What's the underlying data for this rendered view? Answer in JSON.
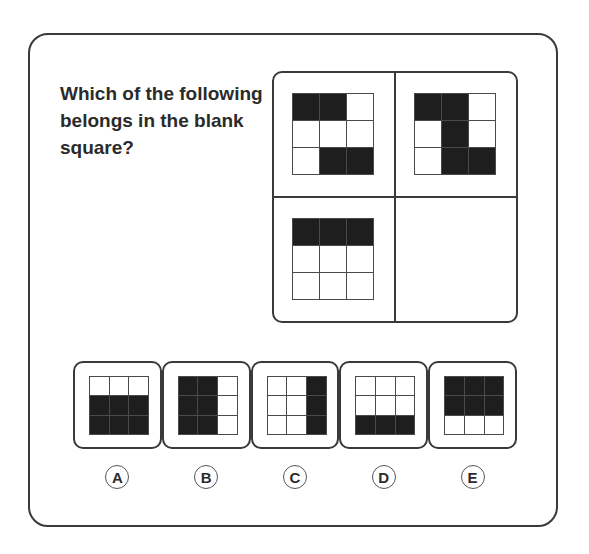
{
  "question": "Which of the following belongs in the blank square?",
  "matrix": {
    "cells": [
      {
        "position": "top-left",
        "pattern": [
          [
            1,
            1,
            0
          ],
          [
            0,
            0,
            0
          ],
          [
            0,
            1,
            1
          ]
        ]
      },
      {
        "position": "top-right",
        "pattern": [
          [
            1,
            1,
            0
          ],
          [
            0,
            1,
            0
          ],
          [
            0,
            1,
            1
          ]
        ]
      },
      {
        "position": "bottom-left",
        "pattern": [
          [
            1,
            1,
            1
          ],
          [
            0,
            0,
            0
          ],
          [
            0,
            0,
            0
          ]
        ]
      },
      {
        "position": "bottom-right",
        "pattern": null,
        "blank": true
      }
    ]
  },
  "options": [
    {
      "label": "A",
      "pattern": [
        [
          0,
          0,
          0
        ],
        [
          1,
          1,
          1
        ],
        [
          1,
          1,
          1
        ]
      ]
    },
    {
      "label": "B",
      "pattern": [
        [
          1,
          1,
          0
        ],
        [
          1,
          1,
          0
        ],
        [
          1,
          1,
          0
        ]
      ]
    },
    {
      "label": "C",
      "pattern": [
        [
          0,
          0,
          1
        ],
        [
          0,
          0,
          1
        ],
        [
          0,
          0,
          1
        ]
      ]
    },
    {
      "label": "D",
      "pattern": [
        [
          0,
          0,
          0
        ],
        [
          0,
          0,
          0
        ],
        [
          1,
          1,
          1
        ]
      ]
    },
    {
      "label": "E",
      "pattern": [
        [
          1,
          1,
          1
        ],
        [
          1,
          1,
          1
        ],
        [
          0,
          0,
          0
        ]
      ]
    }
  ],
  "colors": {
    "fill": "#1e1e1e",
    "border": "#3a3a3a",
    "text": "#2b2b2b"
  }
}
